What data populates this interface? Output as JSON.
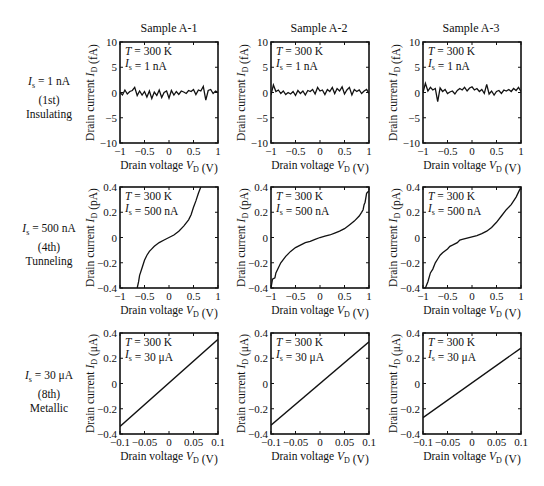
{
  "columns": [
    {
      "title": "Sample A-1"
    },
    {
      "title": "Sample A-2"
    },
    {
      "title": "Sample A-3"
    }
  ],
  "rows": [
    {
      "label_line1": "= 1 nA",
      "label_sym": "I",
      "label_sub": "s",
      "label_line2": "(1st)",
      "label_line3": "Insulating"
    },
    {
      "label_line1": "= 500 nA",
      "label_sym": "I",
      "label_sub": "s",
      "label_line2": "(4th)",
      "label_line3": "Tunneling"
    },
    {
      "label_line1": "= 30 μA",
      "label_sym": "I",
      "label_sub": "s",
      "label_line2": "(8th)",
      "label_line3": "Metallic"
    }
  ],
  "chart_data": [
    {
      "type": "line",
      "row": 0,
      "col": 0,
      "title": "Sample A-1",
      "xlabel": "Drain voltage V_D (V)",
      "ylabel": "Drain current I_D (fA)",
      "xlim": [
        -1,
        1
      ],
      "ylim": [
        -10,
        10
      ],
      "xticks": [
        -1,
        -0.5,
        0,
        0.5,
        1
      ],
      "xtick_labels": [
        "−1",
        "−0.5",
        "0",
        "0.5",
        "1"
      ],
      "yticks": [
        -10,
        -5,
        0,
        5,
        10
      ],
      "ytick_labels": [
        "−10",
        "−5",
        "0",
        "5",
        "10"
      ],
      "annotation": [
        "T = 300 K",
        "I_s = 1 nA"
      ],
      "y_unit": "fA",
      "x": [
        -1,
        -0.95,
        -0.9,
        -0.85,
        -0.8,
        -0.75,
        -0.7,
        -0.65,
        -0.6,
        -0.55,
        -0.5,
        -0.45,
        -0.4,
        -0.35,
        -0.3,
        -0.25,
        -0.2,
        -0.15,
        -0.1,
        -0.05,
        0,
        0.05,
        0.1,
        0.15,
        0.2,
        0.25,
        0.3,
        0.35,
        0.4,
        0.45,
        0.5,
        0.55,
        0.6,
        0.65,
        0.7,
        0.75,
        0.8,
        0.85,
        0.9,
        0.95,
        1
      ],
      "y": [
        0,
        -0.5,
        0.5,
        -0.3,
        0.2,
        0.4,
        1.0,
        -0.6,
        0.3,
        -0.5,
        0.2,
        -0.9,
        0.3,
        -1.2,
        0.1,
        -0.6,
        0.5,
        -1.0,
        0,
        0.3,
        -1.1,
        0.4,
        -0.5,
        0.2,
        -0.4,
        0.3,
        0.1,
        -0.2,
        0.4,
        0.2,
        0.6,
        -0.4,
        0.5,
        0.3,
        1.2,
        -1.5,
        0.4,
        0.6,
        -0.2,
        0.3,
        0
      ]
    },
    {
      "type": "line",
      "row": 0,
      "col": 1,
      "title": "Sample A-2",
      "xlabel": "Drain voltage V_D (V)",
      "ylabel": "Drain current I_D (fA)",
      "xlim": [
        -1,
        1
      ],
      "ylim": [
        -10,
        10
      ],
      "xticks": [
        -1,
        -0.5,
        0,
        0.5,
        1
      ],
      "xtick_labels": [
        "−1",
        "−0.5",
        "0",
        "0.5",
        "1"
      ],
      "yticks": [
        -10,
        -5,
        0,
        5,
        10
      ],
      "ytick_labels": [
        "−10",
        "−5",
        "0",
        "5",
        "10"
      ],
      "annotation": [
        "T = 300 K",
        "I_s = 1 nA"
      ],
      "y_unit": "fA",
      "x": [
        -1,
        -0.95,
        -0.9,
        -0.85,
        -0.8,
        -0.75,
        -0.7,
        -0.65,
        -0.6,
        -0.55,
        -0.5,
        -0.45,
        -0.4,
        -0.35,
        -0.3,
        -0.25,
        -0.2,
        -0.15,
        -0.1,
        -0.05,
        0,
        0.05,
        0.1,
        0.15,
        0.2,
        0.25,
        0.3,
        0.35,
        0.4,
        0.45,
        0.5,
        0.55,
        0.6,
        0.65,
        0.7,
        0.75,
        0.8,
        0.85,
        0.9,
        0.95,
        1
      ],
      "y": [
        -0.5,
        1.5,
        0.2,
        0.5,
        -0.2,
        0.3,
        -0.4,
        0,
        -0.3,
        0.2,
        -0.6,
        0.4,
        -0.2,
        0.3,
        -0.5,
        0.4,
        0.2,
        0.6,
        -0.3,
        1.0,
        0.3,
        0.5,
        -0.4,
        0.6,
        0.2,
        1.0,
        -0.2,
        0.8,
        0.3,
        1.1,
        -0.3,
        0.5,
        1.0,
        -0.5,
        0.6,
        0.2,
        0.5,
        -0.2,
        0.3,
        0.6,
        -0.2
      ]
    },
    {
      "type": "line",
      "row": 0,
      "col": 2,
      "title": "Sample A-3",
      "xlabel": "Drain voltage V_D (V)",
      "ylabel": "Drain current I_D (fA)",
      "xlim": [
        -1,
        1
      ],
      "ylim": [
        -10,
        10
      ],
      "xticks": [
        -1,
        -0.5,
        0,
        0.5,
        1
      ],
      "xtick_labels": [
        "−1",
        "−0.5",
        "0",
        "0.5",
        "1"
      ],
      "yticks": [
        -10,
        -5,
        0,
        5,
        10
      ],
      "ytick_labels": [
        "−10",
        "−5",
        "0",
        "5",
        "10"
      ],
      "annotation": [
        "T = 300 K",
        "I_s = 1 nA"
      ],
      "y_unit": "fA",
      "x": [
        -1,
        -0.95,
        -0.9,
        -0.85,
        -0.8,
        -0.75,
        -0.7,
        -0.65,
        -0.6,
        -0.55,
        -0.5,
        -0.45,
        -0.4,
        -0.35,
        -0.3,
        -0.25,
        -0.2,
        -0.15,
        -0.1,
        -0.05,
        0,
        0.05,
        0.1,
        0.15,
        0.2,
        0.25,
        0.3,
        0.35,
        0.4,
        0.45,
        0.5,
        0.55,
        0.6,
        0.65,
        0.7,
        0.75,
        0.8,
        0.85,
        0.9,
        0.95,
        1
      ],
      "y": [
        0,
        1.8,
        0.3,
        1.0,
        0.5,
        0.8,
        -1.8,
        0.9,
        0.2,
        0.6,
        -0.2,
        0.1,
        0.3,
        -0.3,
        0.4,
        0.8,
        0.5,
        1.0,
        0.3,
        0.9,
        1.1,
        0.5,
        0.8,
        0.2,
        0.6,
        -0.2,
        1.6,
        -0.3,
        0.3,
        -0.5,
        0.2,
        0.4,
        -0.2,
        0.5,
        0.3,
        0.6,
        0.2,
        0.8,
        0.4,
        1.0,
        0.2
      ]
    },
    {
      "type": "line",
      "row": 1,
      "col": 0,
      "xlabel": "Drain voltage V_D (V)",
      "ylabel": "Drain current I_D (pA)",
      "xlim": [
        -1,
        1
      ],
      "ylim": [
        -0.4,
        0.4
      ],
      "xticks": [
        -1,
        -0.5,
        0,
        0.5,
        1
      ],
      "xtick_labels": [
        "−1",
        "−0.5",
        "0",
        "0.5",
        "1"
      ],
      "yticks": [
        -0.4,
        -0.2,
        0,
        0.2,
        0.4
      ],
      "ytick_labels": [
        "−0.4",
        "−0.2",
        "0",
        "0.2",
        "0.4"
      ],
      "annotation": [
        "T = 300 K",
        "I_s = 500 nA"
      ],
      "y_unit": "pA",
      "x": [
        -0.65,
        -0.62,
        -0.6,
        -0.55,
        -0.5,
        -0.45,
        -0.4,
        -0.35,
        -0.3,
        -0.2,
        -0.1,
        0,
        0.1,
        0.2,
        0.3,
        0.4,
        0.45,
        0.5,
        0.55,
        0.6,
        0.65
      ],
      "y": [
        -0.4,
        -0.35,
        -0.3,
        -0.24,
        -0.18,
        -0.14,
        -0.11,
        -0.09,
        -0.07,
        -0.04,
        -0.02,
        0,
        0.02,
        0.05,
        0.09,
        0.14,
        0.18,
        0.24,
        0.29,
        0.35,
        0.4
      ]
    },
    {
      "type": "line",
      "row": 1,
      "col": 1,
      "xlabel": "Drain voltage V_D (V)",
      "ylabel": "Drain current I_D (pA)",
      "xlim": [
        -1,
        1
      ],
      "ylim": [
        -0.4,
        0.4
      ],
      "xticks": [
        -1,
        -0.5,
        0,
        0.5,
        1
      ],
      "xtick_labels": [
        "−1",
        "−0.5",
        "0",
        "0.5",
        "1"
      ],
      "yticks": [
        -0.4,
        -0.2,
        0,
        0.2,
        0.4
      ],
      "ytick_labels": [
        "−0.4",
        "−0.2",
        "0",
        "0.2",
        "0.4"
      ],
      "annotation": [
        "T = 300 K",
        "I_s = 500 nA"
      ],
      "y_unit": "pA",
      "x": [
        -1,
        -0.97,
        -0.92,
        -0.9,
        -0.85,
        -0.8,
        -0.7,
        -0.6,
        -0.5,
        -0.4,
        -0.3,
        -0.2,
        -0.1,
        0,
        0.1,
        0.2,
        0.3,
        0.4,
        0.5,
        0.6,
        0.7,
        0.8,
        0.85,
        0.88,
        0.9,
        0.92,
        0.95,
        1
      ],
      "y": [
        -0.4,
        -0.33,
        -0.32,
        -0.28,
        -0.24,
        -0.2,
        -0.15,
        -0.11,
        -0.08,
        -0.06,
        -0.04,
        -0.03,
        -0.015,
        0,
        0.01,
        0.02,
        0.035,
        0.05,
        0.07,
        0.1,
        0.13,
        0.17,
        0.2,
        0.22,
        0.26,
        0.28,
        0.35,
        0.37
      ]
    },
    {
      "type": "line",
      "row": 1,
      "col": 2,
      "xlabel": "Drain voltage V_D (V)",
      "ylabel": "Drain current I_D (pA)",
      "xlim": [
        -1,
        1
      ],
      "ylim": [
        -0.4,
        0.4
      ],
      "xticks": [
        -1,
        -0.5,
        0,
        0.5,
        1
      ],
      "xtick_labels": [
        "−1",
        "−0.5",
        "0",
        "0.5",
        "1"
      ],
      "yticks": [
        -0.4,
        -0.2,
        0,
        0.2,
        0.4
      ],
      "ytick_labels": [
        "−0.4",
        "−0.2",
        "0",
        "0.2",
        "0.4"
      ],
      "annotation": [
        "T = 300 K",
        "I_s = 500 nA"
      ],
      "y_unit": "pA",
      "x": [
        -0.95,
        -0.9,
        -0.85,
        -0.8,
        -0.75,
        -0.7,
        -0.65,
        -0.6,
        -0.5,
        -0.45,
        -0.4,
        -0.3,
        -0.25,
        -0.2,
        -0.1,
        0,
        0.1,
        0.2,
        0.3,
        0.4,
        0.5,
        0.6,
        0.7,
        0.8,
        0.9,
        0.95,
        1
      ],
      "y": [
        -0.4,
        -0.35,
        -0.28,
        -0.25,
        -0.2,
        -0.17,
        -0.14,
        -0.12,
        -0.09,
        -0.07,
        -0.06,
        -0.04,
        -0.02,
        -0.015,
        -0.005,
        0.005,
        0.015,
        0.03,
        0.05,
        0.08,
        0.12,
        0.17,
        0.22,
        0.26,
        0.32,
        0.36,
        0.4
      ]
    },
    {
      "type": "line",
      "row": 2,
      "col": 0,
      "xlabel": "Drain voltage V_D (V)",
      "ylabel": "Drain current I_D (μA)",
      "xlim": [
        -0.1,
        0.1
      ],
      "ylim": [
        -0.4,
        0.4
      ],
      "xticks": [
        -0.1,
        -0.05,
        0,
        0.05,
        0.1
      ],
      "xtick_labels": [
        "−0.1",
        "−0.05",
        "0",
        "0.05",
        "0.1"
      ],
      "yticks": [
        -0.4,
        -0.2,
        0,
        0.2,
        0.4
      ],
      "ytick_labels": [
        "−0.4",
        "−0.2",
        "0",
        "0.2",
        "0.4"
      ],
      "annotation": [
        "T = 300 K",
        "I_s = 30 μA"
      ],
      "y_unit": "μA",
      "x": [
        -0.1,
        0.1
      ],
      "y": [
        -0.34,
        0.35
      ]
    },
    {
      "type": "line",
      "row": 2,
      "col": 1,
      "xlabel": "Drain voltage V_D (V)",
      "ylabel": "Drain current I_D (μA)",
      "xlim": [
        -0.1,
        0.1
      ],
      "ylim": [
        -0.4,
        0.4
      ],
      "xticks": [
        -0.1,
        -0.05,
        0,
        0.05,
        0.1
      ],
      "xtick_labels": [
        "−0.1",
        "−0.05",
        "0",
        "0.05",
        "0.1"
      ],
      "yticks": [
        -0.4,
        -0.2,
        0,
        0.2,
        0.4
      ],
      "ytick_labels": [
        "−0.4",
        "−0.2",
        "0",
        "0.2",
        "0.4"
      ],
      "annotation": [
        "T = 300 K",
        "I_s = 30 μA"
      ],
      "y_unit": "μA",
      "x": [
        -0.1,
        0.1
      ],
      "y": [
        -0.33,
        0.33
      ]
    },
    {
      "type": "line",
      "row": 2,
      "col": 2,
      "xlabel": "Drain voltage V_D (V)",
      "ylabel": "Drain current I_D (μA)",
      "xlim": [
        -0.1,
        0.1
      ],
      "ylim": [
        -0.4,
        0.4
      ],
      "xticks": [
        -0.1,
        -0.05,
        0,
        0.05,
        0.1
      ],
      "xtick_labels": [
        "−0.1",
        "−0.05",
        "0",
        "0.05",
        "0.1"
      ],
      "yticks": [
        -0.4,
        -0.2,
        0,
        0.2,
        0.4
      ],
      "ytick_labels": [
        "−0.4",
        "−0.2",
        "0",
        "0.2",
        "0.4"
      ],
      "annotation": [
        "T = 300 K",
        "I_s = 30 μA"
      ],
      "y_unit": "μA",
      "x": [
        -0.1,
        0.1
      ],
      "y": [
        -0.27,
        0.28
      ]
    }
  ]
}
